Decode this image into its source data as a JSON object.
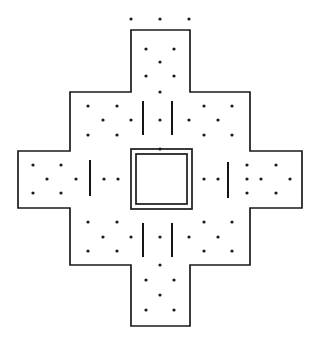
{
  "figure": {
    "kind": "architectural-floor-plan",
    "width": 322,
    "height": 349,
    "background_color": "#ffffff",
    "ink_color": "#1a1a1a"
  },
  "chart_data": {
    "type": "diagram",
    "xlabel": "",
    "ylabel": "",
    "xlim": [
      0,
      322
    ],
    "ylim": [
      0,
      349
    ],
    "grid": false,
    "legend": "none",
    "outline_polygon": [
      [
        131,
        30
      ],
      [
        190,
        30
      ],
      [
        190,
        92
      ],
      [
        250,
        92
      ],
      [
        250,
        151
      ],
      [
        302,
        151
      ],
      [
        302,
        208
      ],
      [
        250,
        208
      ],
      [
        250,
        265
      ],
      [
        190,
        265
      ],
      [
        190,
        326
      ],
      [
        131,
        326
      ],
      [
        131,
        265
      ],
      [
        70,
        265
      ],
      [
        70,
        208
      ],
      [
        18,
        208
      ],
      [
        18,
        151
      ],
      [
        70,
        151
      ],
      [
        70,
        92
      ],
      [
        131,
        92
      ]
    ],
    "core_outer_rect": {
      "x": 131,
      "y": 149,
      "w": 61,
      "h": 60
    },
    "core_inner_rect": {
      "x": 136,
      "y": 154,
      "w": 51,
      "h": 50
    },
    "tick_marks": [
      {
        "x": 143,
        "y1": 101,
        "y2": 135,
        "group": "north"
      },
      {
        "x": 172,
        "y1": 101,
        "y2": 135,
        "group": "north"
      },
      {
        "x": 143,
        "y1": 223,
        "y2": 257,
        "group": "south"
      },
      {
        "x": 172,
        "y1": 223,
        "y2": 257,
        "group": "south"
      },
      {
        "x": 90,
        "y1": 160,
        "y2": 196,
        "group": "west"
      },
      {
        "x": 228,
        "y1": 162,
        "y2": 198,
        "group": "east"
      }
    ],
    "stipple_dots": [
      [
        131,
        19
      ],
      [
        160,
        19
      ],
      [
        189,
        19
      ],
      [
        146,
        49
      ],
      [
        174,
        49
      ],
      [
        160,
        62
      ],
      [
        146,
        76
      ],
      [
        174,
        76
      ],
      [
        160,
        92
      ],
      [
        88,
        106
      ],
      [
        117,
        106
      ],
      [
        204,
        106
      ],
      [
        232,
        106
      ],
      [
        103,
        120
      ],
      [
        131,
        120
      ],
      [
        160,
        120
      ],
      [
        189,
        120
      ],
      [
        218,
        120
      ],
      [
        88,
        135
      ],
      [
        117,
        135
      ],
      [
        204,
        135
      ],
      [
        232,
        135
      ],
      [
        33,
        165
      ],
      [
        61,
        165
      ],
      [
        160,
        149
      ],
      [
        247,
        165
      ],
      [
        276,
        165
      ],
      [
        47,
        179
      ],
      [
        76,
        179
      ],
      [
        104,
        179
      ],
      [
        118,
        179
      ],
      [
        204,
        179
      ],
      [
        218,
        179
      ],
      [
        247,
        179
      ],
      [
        261,
        179
      ],
      [
        290,
        179
      ],
      [
        33,
        193
      ],
      [
        61,
        193
      ],
      [
        247,
        193
      ],
      [
        276,
        193
      ],
      [
        88,
        222
      ],
      [
        117,
        222
      ],
      [
        204,
        222
      ],
      [
        232,
        222
      ],
      [
        103,
        237
      ],
      [
        131,
        237
      ],
      [
        160,
        237
      ],
      [
        189,
        237
      ],
      [
        218,
        237
      ],
      [
        88,
        251
      ],
      [
        117,
        251
      ],
      [
        204,
        251
      ],
      [
        232,
        251
      ],
      [
        160,
        265
      ],
      [
        146,
        280
      ],
      [
        174,
        280
      ],
      [
        160,
        295
      ],
      [
        146,
        310
      ],
      [
        174,
        310
      ]
    ],
    "dot_radius": 1.6
  }
}
